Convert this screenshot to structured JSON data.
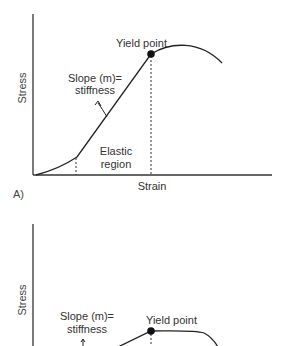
{
  "figure_a": {
    "panel_label": "A)",
    "x_axis_label": "Strain",
    "y_axis_label": "Stress",
    "yield_label": "Yield point",
    "slope_label_line1": "Slope (m)=",
    "slope_label_line2": "stiffness",
    "elastic_label_line1": "Elastic",
    "elastic_label_line2": "region"
  },
  "figure_b": {
    "y_axis_label": "Stress",
    "yield_label": "Yield point",
    "slope_label_line1": "Slope (m)=",
    "slope_label_line2": "stiffness"
  },
  "colors": {
    "axis": "#333333",
    "curve": "#222222",
    "text": "#333333"
  }
}
